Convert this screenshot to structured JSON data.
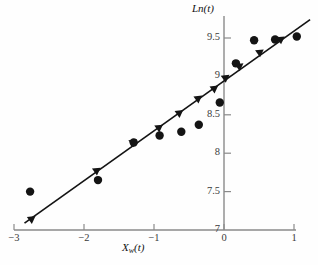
{
  "chart_data": {
    "type": "scatter",
    "title": "",
    "xlabel": "X_w(t)",
    "ylabel": "Ln(t)",
    "xlabel_parts": {
      "main": "X",
      "sub": "w",
      "tail": "(t)"
    },
    "xlim": [
      -3,
      1
    ],
    "ylim": [
      7,
      9.75
    ],
    "grid": false,
    "legend": "none",
    "xticks": [
      -3,
      -2,
      -1,
      0,
      1
    ],
    "xtick_labels": [
      "−3",
      "−2",
      "−1",
      "0",
      "1"
    ],
    "yticks": [
      7,
      7.5,
      8,
      8.5,
      9,
      9.5
    ],
    "ytick_labels": [
      "7",
      "7.5",
      "8",
      "8.5",
      "9",
      "9.5"
    ],
    "series": [
      {
        "name": "observed",
        "marker": "circle",
        "color": "#141414",
        "points": [
          {
            "x": -2.77,
            "y": 7.5
          },
          {
            "x": -1.8,
            "y": 7.65
          },
          {
            "x": -1.29,
            "y": 8.14
          },
          {
            "x": -0.92,
            "y": 8.23
          },
          {
            "x": -0.61,
            "y": 8.28
          },
          {
            "x": -0.36,
            "y": 8.37
          },
          {
            "x": -0.06,
            "y": 8.66
          },
          {
            "x": 0.17,
            "y": 9.17
          },
          {
            "x": 0.43,
            "y": 9.47
          },
          {
            "x": 0.73,
            "y": 9.48
          },
          {
            "x": 1.04,
            "y": 9.52
          }
        ]
      },
      {
        "name": "fitted-line",
        "marker": "triangle",
        "color": "#141414",
        "line": true,
        "line_from": {
          "x": -2.85,
          "y": 7.09
        },
        "line_to": {
          "x": 1.23,
          "y": 9.74
        },
        "points": [
          {
            "x": -2.74,
            "y": 7.15
          },
          {
            "x": -1.81,
            "y": 7.78
          },
          {
            "x": -1.29,
            "y": 8.15
          },
          {
            "x": -0.92,
            "y": 8.34
          },
          {
            "x": -0.63,
            "y": 8.53
          },
          {
            "x": -0.36,
            "y": 8.72
          },
          {
            "x": -0.13,
            "y": 8.85
          },
          {
            "x": 0.03,
            "y": 8.99
          },
          {
            "x": 0.23,
            "y": 9.14
          },
          {
            "x": 0.52,
            "y": 9.32
          },
          {
            "x": 0.82,
            "y": 9.49
          }
        ]
      }
    ]
  }
}
